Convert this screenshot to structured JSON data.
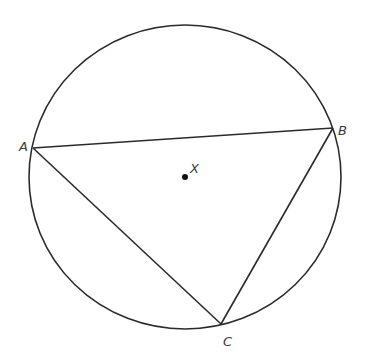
{
  "diagram": {
    "type": "inscribed-triangle-in-circle",
    "stroke_color": "#2b2b2b",
    "label_color": "#3a3a3a",
    "circle": {
      "cx": 185,
      "cy": 177,
      "rx": 156,
      "ry": 152
    },
    "center": {
      "label": "X",
      "x": 185,
      "y": 177
    },
    "vertices": [
      {
        "label": "A",
        "x": 33,
        "y": 148
      },
      {
        "label": "B",
        "x": 333,
        "y": 128
      },
      {
        "label": "C",
        "x": 221,
        "y": 324
      }
    ],
    "segments": [
      "AB",
      "BC",
      "CA"
    ]
  }
}
